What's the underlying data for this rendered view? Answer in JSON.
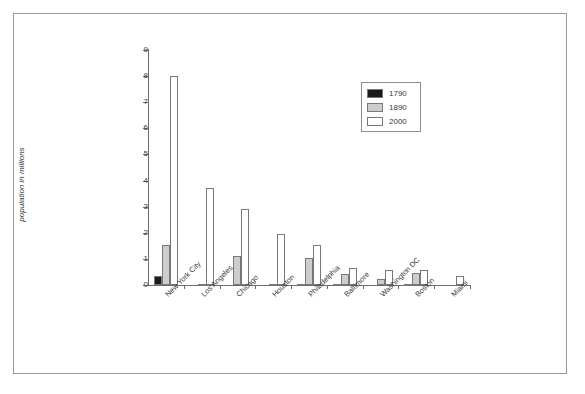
{
  "chart_data": {
    "type": "bar",
    "title": "",
    "xlabel": "",
    "ylabel": "population in millions",
    "ylim": [
      0,
      9
    ],
    "yticks": [
      0,
      1,
      2,
      3,
      4,
      5,
      6,
      7,
      8,
      9
    ],
    "ytick_labels": [
      "0",
      "1",
      "2",
      "3",
      "4",
      "5",
      "6",
      "7",
      "8",
      "9"
    ],
    "grid": false,
    "legend_position": "upper-right",
    "categories": [
      "New York City",
      "Los Angeles",
      "Chicago",
      "Houston",
      "Philadelphia",
      "Baltimore",
      "Washington DC",
      "Boston",
      "Miami"
    ],
    "series": [
      {
        "name": "1790",
        "color": "#1a1a1a",
        "values": [
          0.33,
          0.0,
          0.0,
          0.0,
          0.04,
          0.01,
          0.0,
          0.02,
          0.0
        ]
      },
      {
        "name": "1890",
        "color": "#cdcdcd",
        "values": [
          1.52,
          0.05,
          1.1,
          0.03,
          1.05,
          0.43,
          0.23,
          0.45,
          0.0
        ]
      },
      {
        "name": "2000",
        "color": "#ffffff",
        "values": [
          8.0,
          3.7,
          2.9,
          1.95,
          1.52,
          0.65,
          0.57,
          0.59,
          0.36
        ]
      }
    ]
  },
  "legend": {
    "entries": [
      {
        "label": "1790",
        "color": "#1a1a1a"
      },
      {
        "label": "1890",
        "color": "#cdcdcd"
      },
      {
        "label": "2000",
        "color": "#ffffff"
      }
    ]
  },
  "axes": {
    "y_title": "population in millions"
  }
}
